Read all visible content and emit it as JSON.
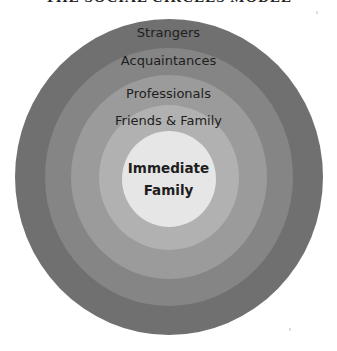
{
  "title": "THE SOCIAL CIRCLES MODEL",
  "diagram": {
    "type": "concentric-circles",
    "center": {
      "x": 168.5,
      "y": 177
    },
    "rings": [
      {
        "id": "strangers",
        "label": "Strangers",
        "color": "#707070",
        "rx": 154,
        "ry": 158
      },
      {
        "id": "acquaintances",
        "label": "Acquaintances",
        "color": "#858585",
        "rx": 124,
        "ry": 129
      },
      {
        "id": "professionals",
        "label": "Professionals",
        "color": "#9b9b9b",
        "rx": 98,
        "ry": 102
      },
      {
        "id": "friends-family",
        "label": "Friends & Family",
        "color": "#b1b1b1",
        "rx": 70,
        "ry": 72
      },
      {
        "id": "immediate-family",
        "label_line1": "Immediate",
        "label_line2": "Family",
        "color": "#e6e6e6",
        "rx": 47,
        "ry": 48
      }
    ]
  }
}
